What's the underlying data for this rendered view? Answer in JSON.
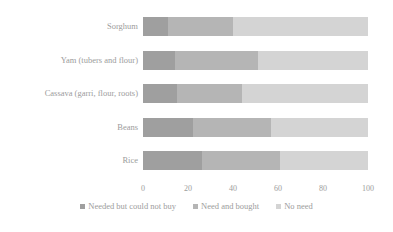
{
  "chart_data": {
    "type": "bar",
    "orientation": "horizontal",
    "stacked": true,
    "title": "",
    "xlabel": "",
    "ylabel": "",
    "xlim": [
      0,
      100
    ],
    "xticks": [
      0,
      20,
      40,
      60,
      80,
      100
    ],
    "grid": false,
    "legend_position": "bottom",
    "categories": [
      "Sorghum",
      "Yam (tubers and flour)",
      "Cassava (garri, flour, roots)",
      "Beans",
      "Rice"
    ],
    "series": [
      {
        "name": "Needed but could not buy",
        "color": "#9f9f9f",
        "values": [
          11,
          14,
          15,
          22,
          26
        ]
      },
      {
        "name": "Need and bought",
        "color": "#b5b5b5",
        "values": [
          29,
          37,
          29,
          35,
          35
        ]
      },
      {
        "name": "No need",
        "color": "#d4d4d4",
        "values": [
          60,
          49,
          56,
          43,
          39
        ]
      }
    ]
  },
  "axis": {
    "x_tick_labels": [
      "0",
      "20",
      "40",
      "60",
      "80",
      "100"
    ]
  },
  "colors": {
    "series_1": "#9f9f9f",
    "series_2": "#b5b5b5",
    "series_3": "#d4d4d4",
    "text": "#9c9c9c",
    "background": "#ffffff"
  }
}
